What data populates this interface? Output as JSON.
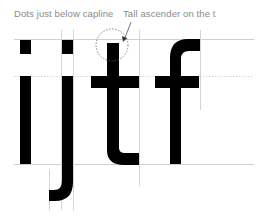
{
  "diagram": {
    "letters": [
      "i",
      "j",
      "t",
      "f"
    ],
    "annotations": [
      {
        "id": "dots",
        "text": "Dots just below capline"
      },
      {
        "id": "ascender",
        "text": "Tall ascender on the t"
      }
    ],
    "guides": {
      "capline": "solid",
      "x_height": "dashed",
      "baseline": "solid"
    },
    "colors": {
      "glyph": "#000000",
      "guide": "#cfcfcf",
      "label": "#8a8a8a",
      "background": "#ffffff"
    }
  }
}
